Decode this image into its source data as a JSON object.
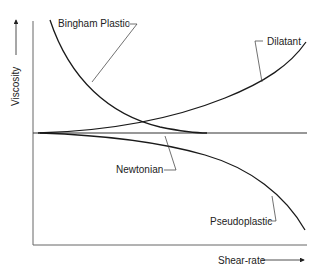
{
  "diagram": {
    "axes": {
      "y_label": "Viscosity",
      "x_label": "Shear-rate"
    },
    "curves": [
      {
        "name": "Bingham Plastic",
        "behavior": "viscosity decreases steeply with shear-rate, flattening toward Newtonian level"
      },
      {
        "name": "Dilatant",
        "behavior": "viscosity increases with shear-rate"
      },
      {
        "name": "Newtonian",
        "behavior": "constant viscosity (horizontal line)"
      },
      {
        "name": "Pseudoplastic",
        "behavior": "viscosity decreases with shear-rate"
      }
    ],
    "labels": {
      "bingham": "Bingham Plastic",
      "dilatant": "Dilatant",
      "newtonian": "Newtonian",
      "pseudoplastic": "Pseudoplastic"
    },
    "colors": {
      "curve": "#1a1a1a",
      "axis": "#555555",
      "leader": "#333333"
    }
  }
}
